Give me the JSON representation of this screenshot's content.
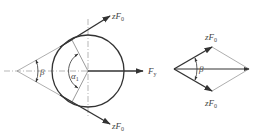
{
  "diagram": {
    "left_figure": {
      "labels": {
        "force_upper": "zF",
        "force_upper_sub": "0",
        "force_lower": "zF",
        "force_lower_sub": "0",
        "radial_force": "F",
        "radial_force_sub": "y",
        "wrap_angle": "α",
        "wrap_angle_sub": "1",
        "belt_angle": "β"
      }
    },
    "right_figure": {
      "labels": {
        "force_upper": "zF",
        "force_upper_sub": "0",
        "force_lower": "zF",
        "force_lower_sub": "0",
        "belt_angle": "β"
      }
    },
    "colors": {
      "stroke": "#333333",
      "thin_stroke": "#777777",
      "background": "#ffffff"
    }
  }
}
